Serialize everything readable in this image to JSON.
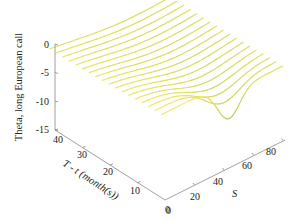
{
  "chart_data": {
    "type": "surface-3d-lines",
    "title": "",
    "zlabel": "Theta, long European call",
    "xlabel": "T - t (month(s))",
    "ylabel": "S",
    "z_ticks": [
      "0",
      "-5",
      "-10",
      "-15"
    ],
    "z_tick_values": [
      0,
      -5,
      -10,
      -15
    ],
    "t_ticks": [
      "40",
      "30",
      "20",
      "10",
      "0"
    ],
    "t_tick_values": [
      40,
      30,
      20,
      10,
      0
    ],
    "s_ticks": [
      "0",
      "20",
      "40",
      "60",
      "80"
    ],
    "s_tick_values": [
      0,
      20,
      40,
      60,
      80
    ],
    "zlim": [
      -15,
      0
    ],
    "tlim": [
      0,
      42
    ],
    "slim": [
      0,
      82
    ],
    "strike": 45,
    "series_count": 18,
    "series_T_values": [
      42,
      39.6,
      37.2,
      34.8,
      32.4,
      30,
      27.6,
      25.2,
      22.8,
      20.4,
      18,
      15.6,
      13.2,
      10.8,
      8.4,
      6,
      3.6,
      1.2
    ],
    "theta_min_at_T_near_0": -14.5,
    "theta_plateau_low_S": -0.3,
    "theta_plateau_high_S": -2.6,
    "colormap": [
      "#3b2f6b",
      "#3f6f8a",
      "#4f9a86",
      "#8fbf6a",
      "#cfd65a",
      "#f2e86a",
      "#e8a860"
    ],
    "grid": false,
    "legend": "none"
  }
}
